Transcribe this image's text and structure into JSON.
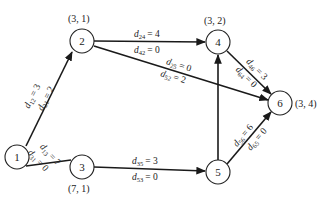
{
  "diagram": {
    "nodes": [
      {
        "id": "1",
        "label": "1",
        "x": 17,
        "y": 157,
        "coord": ""
      },
      {
        "id": "2",
        "label": "2",
        "x": 82,
        "y": 41,
        "coord": "(3, 1)"
      },
      {
        "id": "3",
        "label": "3",
        "x": 82,
        "y": 167,
        "coord": "(7, 1)"
      },
      {
        "id": "4",
        "label": "4",
        "x": 218,
        "y": 42,
        "coord": "(3, 2)"
      },
      {
        "id": "5",
        "label": "5",
        "x": 218,
        "y": 172,
        "coord": ""
      },
      {
        "id": "6",
        "label": "6",
        "x": 280,
        "y": 103,
        "coord": "(3, 4)"
      }
    ],
    "edges": [
      {
        "from": "1",
        "to": "2",
        "labels": [
          {
            "d": "d",
            "sub": "12",
            "val": "= 3"
          },
          {
            "d": "d",
            "sub": "21",
            "val": "= 2"
          }
        ]
      },
      {
        "from": "1",
        "to": "3",
        "labels": [
          {
            "d": "d",
            "sub": "13",
            "val": "= 7"
          },
          {
            "d": "d",
            "sub": "31",
            "val": "= 0"
          }
        ]
      },
      {
        "from": "2",
        "to": "4",
        "labels": [
          {
            "d": "d",
            "sub": "24",
            "val": "= 4"
          },
          {
            "d": "d",
            "sub": "42",
            "val": "= 0"
          }
        ]
      },
      {
        "from": "2",
        "to": "6",
        "labels": [
          {
            "d": "d",
            "sub": "25",
            "val": "= 0"
          },
          {
            "d": "d",
            "sub": "52",
            "val": "= 2"
          }
        ]
      },
      {
        "from": "3",
        "to": "5",
        "labels": [
          {
            "d": "d",
            "sub": "35",
            "val": "= 3"
          },
          {
            "d": "d",
            "sub": "53",
            "val": "= 0"
          }
        ]
      },
      {
        "from": "5",
        "to": "4",
        "labels": []
      },
      {
        "from": "4",
        "to": "6",
        "labels": [
          {
            "d": "d",
            "sub": "46",
            "val": "= 3"
          },
          {
            "d": "d",
            "sub": "64",
            "val": "= 0"
          }
        ]
      },
      {
        "from": "5",
        "to": "6",
        "labels": [
          {
            "d": "d",
            "sub": "56",
            "val": "= 6"
          },
          {
            "d": "d",
            "sub": "65",
            "val": "= 0"
          }
        ]
      }
    ]
  }
}
